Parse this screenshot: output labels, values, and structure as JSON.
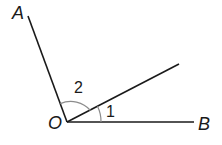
{
  "diagram": {
    "type": "angle-diagram",
    "points": {
      "vertex": "O",
      "ray_a_label": "A",
      "ray_b_label": "B"
    },
    "angles": [
      {
        "label": "1",
        "between": "OB and middle ray"
      },
      {
        "label": "2",
        "between": "OA and middle ray"
      }
    ],
    "colors": {
      "line": "#1a1a1a",
      "arc": "#8c8c8c"
    }
  }
}
